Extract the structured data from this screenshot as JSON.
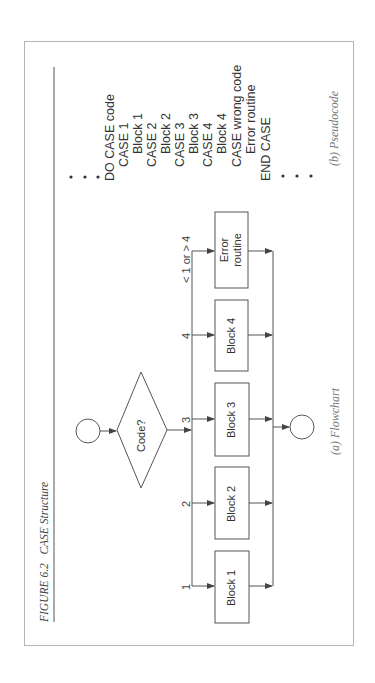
{
  "figure": {
    "number": "FIGURE 6.2",
    "title": "CASE Structure"
  },
  "flowchart": {
    "caption": "(a) Flowchart",
    "decision": "Code?",
    "branches": [
      {
        "label": "1",
        "block": "Block 1"
      },
      {
        "label": "2",
        "block": "Block 2"
      },
      {
        "label": "3",
        "block": "Block 3"
      },
      {
        "label": "4",
        "block": "Block 4"
      },
      {
        "label": "< 1 or > 4",
        "block_line1": "Error",
        "block_line2": "routine"
      }
    ]
  },
  "pseudocode": {
    "caption": "(b) Pseudocode",
    "lines": [
      "DO CASE code",
      "CASE 1",
      "Block 1",
      "CASE 2",
      "Block 2",
      "CASE 3",
      "Block 3",
      "CASE 4",
      "Block 4",
      "CASE wrong code",
      "Error routine",
      "END CASE"
    ],
    "ellipsis": "•"
  },
  "colors": {
    "line": "#555555",
    "frame": "#b5b5b5",
    "text": "#333333"
  }
}
